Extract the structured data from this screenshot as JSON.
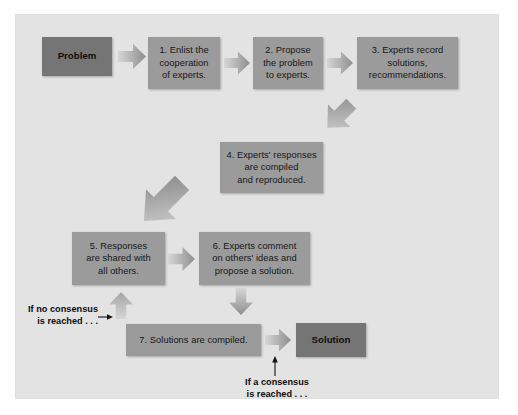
{
  "figure": {
    "panel_background": "#e3e3e3",
    "page_background": "#ffffff",
    "box_fill": "#9b9b9b",
    "terminal_fill": "#757575",
    "arrow_fill_light": "#cfcfcf",
    "arrow_fill_dark": "#8f8f8f",
    "text_color": "#161616"
  },
  "nodes": {
    "problem": {
      "label": "Problem",
      "kind": "terminal"
    },
    "step1": {
      "label": "1. Enlist the cooperation of experts.",
      "kind": "process"
    },
    "step2": {
      "label": "2. Propose the problem to experts.",
      "kind": "process"
    },
    "step3": {
      "label": "3. Experts record solutions, recommendations.",
      "kind": "process"
    },
    "step4": {
      "label": "4. Experts' responses are compiled and reproduced.",
      "kind": "process"
    },
    "step5": {
      "label": "5. Responses are shared with all others.",
      "kind": "process"
    },
    "step6": {
      "label": "6. Experts comment on others' ideas and propose a solution.",
      "kind": "process"
    },
    "step7": {
      "label": "7. Solutions are compiled.",
      "kind": "process"
    },
    "solution": {
      "label": "Solution",
      "kind": "terminal"
    }
  },
  "node_lines": {
    "problem": [
      "Problem"
    ],
    "step1": [
      "1. Enlist the",
      "cooperation",
      "of experts."
    ],
    "step2": [
      "2. Propose",
      "the problem",
      "to experts."
    ],
    "step3": [
      "3. Experts record",
      "solutions,",
      "recommendations."
    ],
    "step4": [
      "4. Experts' responses",
      "are compiled",
      "and reproduced."
    ],
    "step5": [
      "5. Responses",
      "are shared with",
      "all others."
    ],
    "step6": [
      "6. Experts comment",
      "on others' ideas and",
      "propose a solution."
    ],
    "step7": [
      "7. Solutions are compiled."
    ],
    "solution": [
      "Solution"
    ]
  },
  "captions": {
    "no_consensus_line1": "If no consensus",
    "no_consensus_line2": "is reached . . .",
    "yes_consensus_line1": "If a consensus",
    "yes_consensus_line2": "is reached . . ."
  },
  "connectors": [
    {
      "from": "problem",
      "to": "step1",
      "direction": "right"
    },
    {
      "from": "step1",
      "to": "step2",
      "direction": "right"
    },
    {
      "from": "step2",
      "to": "step3",
      "direction": "right"
    },
    {
      "from": "step3",
      "to": "step4",
      "direction": "down-left-diagonal"
    },
    {
      "from": "step4",
      "to": "step5",
      "direction": "down-left-diagonal"
    },
    {
      "from": "step5",
      "to": "step6",
      "direction": "right"
    },
    {
      "from": "step6",
      "to": "step7",
      "direction": "down"
    },
    {
      "from": "step7",
      "to": "solution",
      "direction": "right"
    },
    {
      "from": "step7",
      "to": "step5",
      "direction": "up",
      "label": "If no consensus is reached . . ."
    },
    {
      "from": "step7",
      "to": "solution",
      "direction": "up-annotation",
      "label": "If a consensus is reached . . ."
    }
  ]
}
